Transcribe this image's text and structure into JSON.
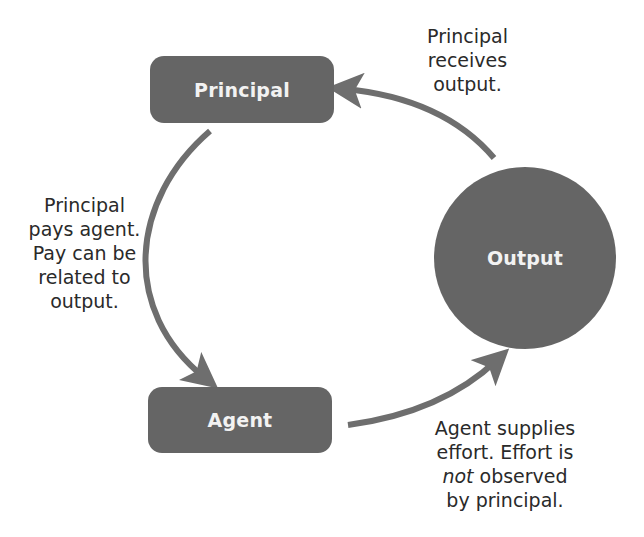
{
  "diagram": {
    "colors": {
      "node_fill": "#656565",
      "node_text": "#f2f2f2",
      "arrow": "#6e6e6e",
      "label_text": "#2a2a2a",
      "background": "#ffffff"
    },
    "nodes": {
      "principal": {
        "label": "Principal",
        "shape": "rounded-rectangle"
      },
      "output": {
        "label": "Output",
        "shape": "circle"
      },
      "agent": {
        "label": "Agent",
        "shape": "rounded-rectangle"
      }
    },
    "edges": [
      {
        "from": "principal",
        "to": "agent",
        "label": "Principal pays agent. Pay can be related to output."
      },
      {
        "from": "agent",
        "to": "output",
        "label": "Agent supplies effort. Effort is not observed by principal."
      },
      {
        "from": "output",
        "to": "principal",
        "label": "Principal receives output."
      }
    ],
    "labels": {
      "principal_receives": {
        "line1": "Principal",
        "line2": "receives",
        "line3": "output."
      },
      "principal_pays": {
        "line1": "Principal",
        "line2": "pays agent.",
        "line3": "Pay can be",
        "line4": "related to",
        "line5": "output."
      },
      "agent_supplies": {
        "line1": "Agent supplies",
        "line2": "effort. Effort is",
        "line3_emphasis": "not",
        "line3_rest": " observed",
        "line4": "by principal."
      }
    }
  }
}
